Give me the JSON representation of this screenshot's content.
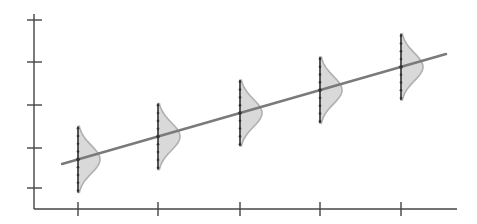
{
  "figure": {
    "type": "regression-with-conditional-distributions",
    "colors": {
      "axis": "#444444",
      "line": "#7a7a7a",
      "fill": "#d9d9d9",
      "curve_edge": "#b0b0b0",
      "whisker": "#333333"
    }
  },
  "axes": {
    "x_ticks": 5,
    "y_ticks": 5,
    "x_tick_labels": [],
    "y_tick_labels": [],
    "xlabel": "",
    "ylabel": ""
  },
  "chart_data": {
    "type": "line",
    "title": "",
    "xlabel": "",
    "ylabel": "",
    "x": [
      1,
      2,
      3,
      4,
      5
    ],
    "series": [
      {
        "name": "regression line (mean of y|x)",
        "values": [
          1.35,
          1.95,
          2.55,
          3.15,
          3.75
        ]
      }
    ],
    "distributions": [
      {
        "x": 1,
        "mean": 1.35,
        "spread": "normal"
      },
      {
        "x": 2,
        "mean": 1.95,
        "spread": "normal"
      },
      {
        "x": 3,
        "mean": 2.55,
        "spread": "normal"
      },
      {
        "x": 4,
        "mean": 3.15,
        "spread": "normal"
      },
      {
        "x": 5,
        "mean": 3.75,
        "spread": "normal"
      }
    ],
    "grid": false,
    "legend": "none"
  }
}
